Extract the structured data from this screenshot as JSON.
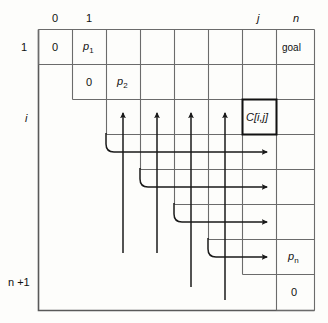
{
  "figure": {
    "type": "grid-diagram",
    "title": ""
  },
  "axis": {
    "column_labels": [
      {
        "text": "0",
        "col": 0
      },
      {
        "text": "1",
        "col": 1
      },
      {
        "text": "j",
        "col": 6
      },
      {
        "text": "n",
        "col": 7
      }
    ],
    "row_labels": [
      {
        "text": "1",
        "row": 0
      },
      {
        "text": "i",
        "row": 2
      },
      {
        "text": "n +1",
        "row": 7
      }
    ]
  },
  "cells": [
    {
      "row": 0,
      "col": 0,
      "text": "0",
      "italic": false
    },
    {
      "row": 0,
      "col": 1,
      "text": "p",
      "sub": "1",
      "italic": true
    },
    {
      "row": 0,
      "col": 7,
      "text": "goal",
      "italic": false
    },
    {
      "row": 1,
      "col": 1,
      "text": "0",
      "italic": false
    },
    {
      "row": 1,
      "col": 2,
      "text": "p",
      "sub": "2",
      "italic": true
    },
    {
      "row": 2,
      "col": 6,
      "text": "C[i,j]",
      "italic": true,
      "highlight": true
    },
    {
      "row": 6,
      "col": 7,
      "text": "p",
      "sub": "n",
      "italic": true
    },
    {
      "row": 7,
      "col": 7,
      "text": "0",
      "italic": false
    }
  ],
  "arrows": {
    "up_count": 4,
    "right_count": 4,
    "note": "four vertical up-arrows into row i, four curved arrows turning right toward column n"
  },
  "colors": {
    "line": "#595959",
    "bold_line": "#111111",
    "arrow": "#1a1a1a",
    "background": "#fdfdfb",
    "text": "#111111"
  }
}
